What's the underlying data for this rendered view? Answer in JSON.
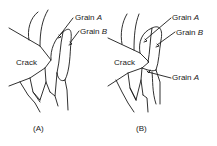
{
  "figure": {
    "panels": [
      {
        "id": "A",
        "caption": "(A)",
        "crack_label": "Crack",
        "labels": [
          {
            "prefix": "Grain",
            "letter": "A"
          },
          {
            "prefix": "Grain",
            "letter": "B"
          }
        ]
      },
      {
        "id": "B",
        "caption": "(B)",
        "crack_label": "Crack",
        "labels": [
          {
            "prefix": "Grain",
            "letter": "A"
          },
          {
            "prefix": "Grain",
            "letter": "B"
          },
          {
            "prefix": "Grain",
            "letter": "A"
          }
        ]
      }
    ],
    "colors": {
      "line": "#1a1a1a",
      "background": "#ffffff"
    }
  }
}
